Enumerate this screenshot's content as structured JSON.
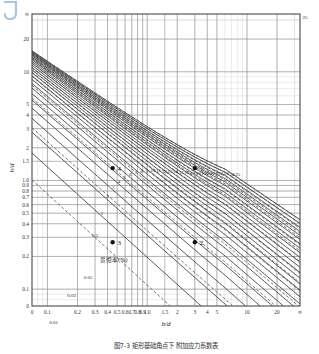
{
  "figure": {
    "corner_mark": "J",
    "caption": "图7-3  矩形基础角点下  附加应力系数表",
    "annotation_cn": "贯彻率(%)"
  },
  "chart_data": {
    "type": "line",
    "title": "",
    "subtitle": "",
    "xlabel": "b/d",
    "ylabel": "h/d",
    "xscale": "log",
    "yscale": "log",
    "grid": true,
    "legend_position": "none",
    "xlim": [
      0.07,
      40
    ],
    "ylim": [
      0.0,
      40
    ],
    "x_tick_labels": [
      "0",
      "0.1",
      "0.2",
      "0.3",
      "0.4",
      "0.5",
      "0.6",
      "0.7",
      "0.8",
      "0.9",
      "1.0",
      "1.5",
      "2",
      "3",
      "4",
      "5",
      "10",
      "20",
      "∞"
    ],
    "x_tick_values": [
      0.07,
      0.1,
      0.2,
      0.3,
      0.4,
      0.5,
      0.6,
      0.7,
      0.8,
      0.9,
      1.0,
      1.5,
      2,
      3,
      4,
      5,
      10,
      20,
      34
    ],
    "y_tick_labels": [
      "0",
      "0.1",
      "0.2",
      "0.3",
      "0.4",
      "0.5",
      "0.6",
      "0.7",
      "0.8",
      "0.9",
      "1.0",
      "1.5",
      "2",
      "3",
      "4",
      "5",
      "10",
      "20",
      "∞"
    ],
    "y_tick_values": [
      0.07,
      0.1,
      0.2,
      0.3,
      0.4,
      0.5,
      0.6,
      0.7,
      0.8,
      0.9,
      1.0,
      1.5,
      2,
      3,
      4,
      5,
      10,
      20,
      34
    ],
    "corner_label_top_right": "25",
    "solid_series": {
      "name": "整数族曲线",
      "style": "solid",
      "color": "#3a3a3a",
      "labels": [
        "1",
        "2",
        "3",
        "4",
        "5",
        "6",
        "7",
        "8",
        "9",
        "10",
        "11",
        "12",
        "13",
        "14",
        "15",
        "16",
        "17",
        "18",
        "19",
        "20",
        "21",
        "22",
        "23",
        "24",
        "25"
      ],
      "values": [
        1,
        2,
        3,
        4,
        5,
        6,
        7,
        8,
        9,
        10,
        11,
        12,
        13,
        14,
        15,
        16,
        17,
        18,
        19,
        20,
        21,
        22,
        23,
        24,
        25
      ]
    },
    "dashed_series": {
      "name": "贯彻率(%)",
      "style": "dashed",
      "color": "#4a4a4a",
      "labels": [
        "0.01",
        "0.02",
        "0.05",
        "0.1",
        "0.2",
        "0.3",
        "0.5",
        "1",
        "2",
        "3",
        "5",
        "7",
        "10",
        "15",
        "20"
      ],
      "values": [
        0.01,
        0.02,
        0.05,
        0.1,
        0.2,
        0.3,
        0.5,
        1,
        2,
        3,
        5,
        7,
        10,
        15,
        20
      ]
    },
    "marked_points": [
      {
        "label": "1",
        "x": 3.0,
        "y": 1.3
      },
      {
        "label": "2",
        "x": 3.0,
        "y": 0.27
      },
      {
        "label": "3",
        "x": 0.45,
        "y": 0.27
      },
      {
        "label": "4",
        "x": 0.45,
        "y": 1.3
      }
    ],
    "inner_dashed_labels": [
      {
        "text": "0.01",
        "x": 0.115,
        "y": 0.048
      },
      {
        "text": "0.02",
        "x": 0.175,
        "y": 0.085
      },
      {
        "text": "0.05",
        "x": 0.255,
        "y": 0.125
      },
      {
        "text": "0.5",
        "x": 0.3,
        "y": 0.3
      }
    ]
  }
}
